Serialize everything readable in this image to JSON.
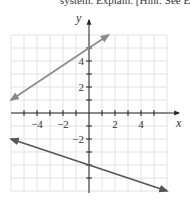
{
  "caption": "system. Explain. [Hint: See Ex",
  "chart_data": {
    "type": "line",
    "title": "",
    "xlabel": "x",
    "ylabel": "y",
    "xlim": [
      -6,
      6
    ],
    "ylim": [
      -6,
      6
    ],
    "grid": true,
    "x_tick_labels": [
      {
        "value": -4,
        "text": "−4"
      },
      {
        "value": -2,
        "text": "−2"
      },
      {
        "value": 2,
        "text": "2"
      },
      {
        "value": 4,
        "text": "4"
      }
    ],
    "y_tick_labels": [
      {
        "value": 4,
        "text": "4"
      },
      {
        "value": 2,
        "text": "2"
      },
      {
        "value": -2,
        "text": "−2"
      }
    ],
    "series": [
      {
        "name": "upper-line",
        "color": "#8a8a8a",
        "points": [
          [
            -6,
            1
          ],
          [
            1.5,
            6
          ]
        ]
      },
      {
        "name": "lower-line",
        "color": "#555555",
        "points": [
          [
            -6,
            -2
          ],
          [
            6,
            -6
          ]
        ]
      }
    ]
  }
}
